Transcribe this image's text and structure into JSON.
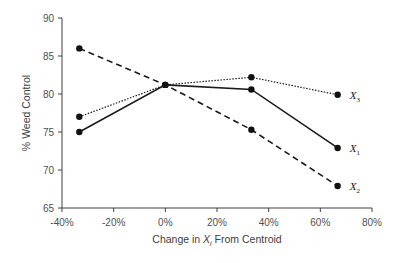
{
  "chart_data": {
    "type": "line",
    "title": "",
    "xlabel": "Change in X_i From Centroid",
    "xlabel_parts": {
      "pre": "Change in ",
      "var": "X",
      "sub": "i",
      "post": " From Centroid"
    },
    "ylabel": "% Weed Control",
    "xlim": [
      -40,
      80
    ],
    "ylim": [
      65,
      90
    ],
    "x_ticks": [
      "-40%",
      "-20%",
      "0%",
      "20%",
      "40%",
      "60%",
      "80%"
    ],
    "x_tick_values": [
      -40,
      -20,
      0,
      20,
      40,
      60,
      80
    ],
    "y_ticks": [
      "65",
      "70",
      "75",
      "80",
      "85",
      "90"
    ],
    "y_tick_values": [
      65,
      70,
      75,
      80,
      85,
      90
    ],
    "grid": false,
    "legend_position": "inline-right",
    "x": [
      -33.3,
      0,
      33.3,
      66.7
    ],
    "series": [
      {
        "name": "X1",
        "label_var": "X",
        "label_sub": "1",
        "style": "solid",
        "values": [
          75.0,
          81.2,
          80.6,
          72.9
        ]
      },
      {
        "name": "X2",
        "label_var": "X",
        "label_sub": "2",
        "style": "dashed",
        "values": [
          86.0,
          81.2,
          75.3,
          67.9
        ]
      },
      {
        "name": "X3",
        "label_var": "X",
        "label_sub": "3",
        "style": "dotted",
        "values": [
          77.0,
          81.2,
          82.2,
          79.9
        ]
      }
    ]
  }
}
